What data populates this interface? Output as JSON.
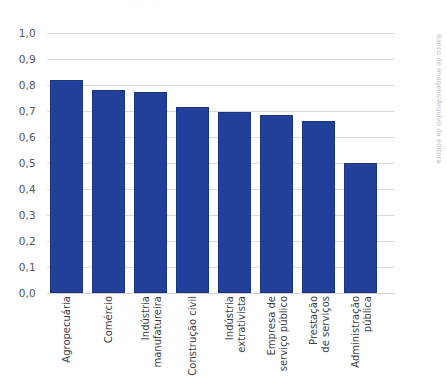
{
  "figure": {
    "title_ghost": "Participação por setor de atividade",
    "credit": "Banco de imagens/Arquivo da editora"
  },
  "chart_data": {
    "type": "bar",
    "title": "Participação por setor de atividade",
    "xlabel": "",
    "ylabel": "",
    "ylim": [
      0.0,
      1.0
    ],
    "grid": true,
    "legend": "none",
    "bar_color": "#21409A",
    "decimal_separator": ",",
    "ytick_labels": [
      "1,0",
      "0,9",
      "0,8",
      "0,7",
      "0,6",
      "0,5",
      "0,4",
      "0,3",
      "0,2",
      "0,1",
      "0,0"
    ],
    "ytick_values": [
      1.0,
      0.9,
      0.8,
      0.7,
      0.6,
      0.5,
      0.4,
      0.3,
      0.2,
      0.1,
      0.0
    ],
    "categories": [
      "Agropecuária",
      "Comércio",
      "Indústria manufatureira",
      "Construção civil",
      "Indústria extrativista",
      "Empresa de serviço público",
      "Prestação de serviços",
      "Administração pública"
    ],
    "category_lines": [
      [
        "Agropecuária"
      ],
      [
        "Comércio"
      ],
      [
        "Indústria",
        "manufatureira"
      ],
      [
        "Construção civil"
      ],
      [
        "Indústria",
        "extrativista"
      ],
      [
        "Empresa de",
        "serviço público"
      ],
      [
        "Prestação",
        "de serviços"
      ],
      [
        "Administração",
        "pública"
      ]
    ],
    "values": [
      0.82,
      0.78,
      0.775,
      0.715,
      0.695,
      0.685,
      0.66,
      0.5
    ]
  }
}
